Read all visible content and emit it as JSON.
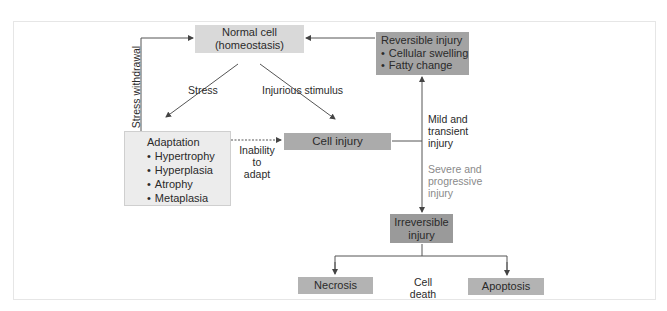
{
  "diagram": {
    "nodes": {
      "normal_cell": {
        "line1": "Normal cell",
        "line2": "(homeostasis)"
      },
      "reversible": {
        "title": "Reversible injury",
        "items": [
          "Cellular swelling",
          "Fatty change"
        ]
      },
      "adaptation": {
        "title": "Adaptation",
        "items": [
          "Hypertrophy",
          "Hyperplasia",
          "Atrophy",
          "Metaplasia"
        ]
      },
      "cell_injury": {
        "label": "Cell injury"
      },
      "irreversible": {
        "line1": "Irreversible",
        "line2": "injury"
      },
      "necrosis": {
        "label": "Necrosis"
      },
      "apoptosis": {
        "label": "Apoptosis"
      }
    },
    "edge_labels": {
      "stress": "Stress",
      "injurious_stimulus": "Injurious stimulus",
      "stress_withdrawal": "Stress withdrawal",
      "inability_line1": "Inability to",
      "inability_line2": "adapt",
      "mild_line1": "Mild and",
      "mild_line2": "transient",
      "mild_line3": "injury",
      "severe_line1": "Severe and",
      "severe_line2": "progressive",
      "severe_line3": "injury",
      "cell_death_line1": "Cell",
      "cell_death_line2": "death"
    },
    "colors": {
      "light_box": "#d9d9d9",
      "mid_box": "#b3b3b3",
      "dark_box": "#9a9a9a",
      "adaptation_box": "#ececec",
      "severe_text": "#8a8a8a",
      "line": "#444444"
    }
  }
}
